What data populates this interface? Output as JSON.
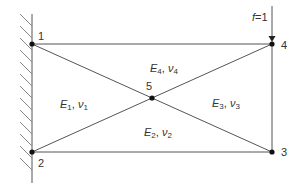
{
  "diagram": {
    "type": "finite-element-mesh",
    "colors": {
      "line": "#555555",
      "node": "#111111",
      "hatch": "#888888",
      "text": "#333333"
    },
    "nodes": [
      {
        "id": "1",
        "label": "1",
        "x": 32,
        "y": 44
      },
      {
        "id": "2",
        "label": "2",
        "x": 32,
        "y": 152
      },
      {
        "id": "3",
        "label": "3",
        "x": 272,
        "y": 152
      },
      {
        "id": "4",
        "label": "4",
        "x": 272,
        "y": 44
      },
      {
        "id": "5",
        "label": "5",
        "x": 152,
        "y": 98
      }
    ],
    "edges": [
      [
        "1",
        "4"
      ],
      [
        "2",
        "3"
      ],
      [
        "3",
        "4"
      ],
      [
        "1",
        "2"
      ],
      [
        "1",
        "5"
      ],
      [
        "5",
        "3"
      ],
      [
        "2",
        "5"
      ],
      [
        "5",
        "4"
      ]
    ],
    "elements": [
      {
        "id": "1",
        "E": "E",
        "sub": "1",
        "nu": "ν",
        "label": "E1, ν1"
      },
      {
        "id": "2",
        "E": "E",
        "sub": "2",
        "nu": "ν",
        "label": "E2, ν2"
      },
      {
        "id": "3",
        "E": "E",
        "sub": "3",
        "nu": "ν",
        "label": "E3, ν3"
      },
      {
        "id": "4",
        "E": "E",
        "sub": "4",
        "nu": "ν",
        "label": "E4, ν4"
      }
    ],
    "load": {
      "label_var": "f",
      "label_eq": "=1",
      "node": "4",
      "direction": "down"
    },
    "support": {
      "type": "fixed-wall",
      "side": "left"
    }
  }
}
